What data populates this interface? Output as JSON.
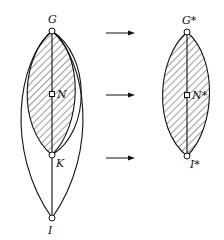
{
  "diagram": {
    "left_graph": {
      "nodes": [
        {
          "id": "G",
          "label": "G",
          "x": 52,
          "y": 31
        },
        {
          "id": "N",
          "label": "N",
          "x": 52,
          "y": 94
        },
        {
          "id": "K",
          "label": "K",
          "x": 52,
          "y": 155
        },
        {
          "id": "I",
          "label": "I",
          "x": 52,
          "y": 218
        }
      ],
      "shaded_region": "G-K lens (hatched)",
      "outer_region": "G-I lens (unshaded)"
    },
    "right_graph": {
      "nodes": [
        {
          "id": "G*",
          "label": "G",
          "star": "*",
          "x": 187,
          "y": 32
        },
        {
          "id": "N*",
          "label": "N",
          "star": "*",
          "x": 187,
          "y": 95
        },
        {
          "id": "I*",
          "label": "I",
          "star": "*",
          "x": 187,
          "y": 156
        }
      ],
      "shaded_region": "G*-I* lens (hatched)"
    },
    "arrows": [
      {
        "from": "G",
        "to": "G*",
        "y": 33
      },
      {
        "from": "N",
        "to": "N*",
        "y": 95
      },
      {
        "from": "K",
        "to": "I*",
        "y": 155
      }
    ],
    "labels": {
      "G": "G",
      "N": "N",
      "K": "K",
      "I": "I",
      "G_star": "G*",
      "N_star": "N*",
      "I_star": "I*"
    }
  }
}
